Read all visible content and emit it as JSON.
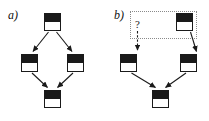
{
  "figure": {
    "background_color": "#ffffff",
    "ink_color": "#1a1a1a",
    "annotation_color": "#8a8a8a",
    "width": 209,
    "height": 121
  },
  "panels": [
    {
      "id": "a",
      "label": "a)",
      "node_style": "half-filled-square",
      "nodes": [
        {
          "id": "a-top",
          "name": "node-top",
          "x": 44,
          "y": 13,
          "top_fill": "#1a1a1a",
          "bottom_fill": "#ffffff"
        },
        {
          "id": "a-left",
          "name": "node-left",
          "x": 21,
          "y": 54,
          "top_fill": "#1a1a1a",
          "bottom_fill": "#ffffff"
        },
        {
          "id": "a-right",
          "name": "node-right",
          "x": 67,
          "y": 54,
          "top_fill": "#1a1a1a",
          "bottom_fill": "#ffffff"
        },
        {
          "id": "a-bottom",
          "name": "node-bottom",
          "x": 44,
          "y": 90,
          "top_fill": "#1a1a1a",
          "bottom_fill": "#ffffff"
        }
      ],
      "edges": [
        {
          "from": "a-top",
          "to": "a-left",
          "arrow": true
        },
        {
          "from": "a-top",
          "to": "a-right",
          "arrow": true
        },
        {
          "from": "a-left",
          "to": "a-bottom",
          "arrow": true
        },
        {
          "from": "a-right",
          "to": "a-bottom",
          "arrow": true
        }
      ]
    },
    {
      "id": "b",
      "label": "b)",
      "node_style": "half-filled-square",
      "annotation": {
        "question_mark": "?",
        "box_style": "dotted",
        "arrow_style": "dashed-down"
      },
      "nodes": [
        {
          "id": "b-top",
          "name": "node-top",
          "x": 72,
          "y": 13,
          "top_fill": "#1a1a1a",
          "bottom_fill": "#ffffff"
        },
        {
          "id": "b-left",
          "name": "node-left",
          "x": 16,
          "y": 54,
          "top_fill": "#1a1a1a",
          "bottom_fill": "#ffffff"
        },
        {
          "id": "b-right",
          "name": "node-right",
          "x": 76,
          "y": 54,
          "top_fill": "#1a1a1a",
          "bottom_fill": "#ffffff"
        },
        {
          "id": "b-bottom",
          "name": "node-bottom",
          "x": 48,
          "y": 90,
          "top_fill": "#1a1a1a",
          "bottom_fill": "#ffffff"
        }
      ],
      "edges": [
        {
          "from": "b-top",
          "to": "b-right",
          "arrow": true
        },
        {
          "from": "b-left",
          "to": "b-bottom",
          "arrow": true
        },
        {
          "from": "b-right",
          "to": "b-bottom",
          "arrow": true
        }
      ]
    }
  ]
}
